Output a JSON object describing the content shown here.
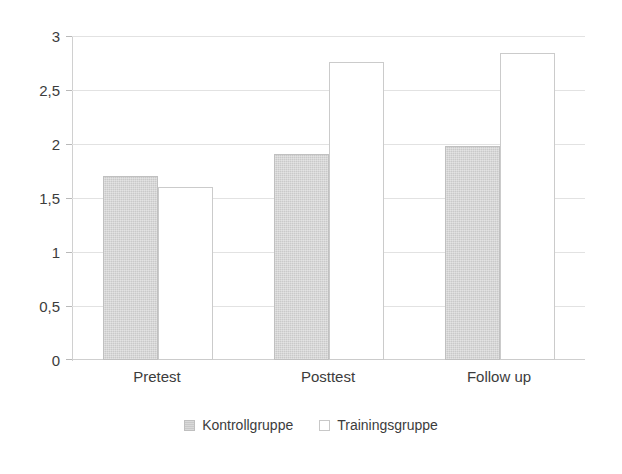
{
  "chart_data": {
    "type": "bar",
    "title": "",
    "subtitle": "",
    "xlabel": "",
    "ylabel": "",
    "categories": [
      "Pretest",
      "Posttest",
      "Follow up"
    ],
    "series": [
      {
        "name": "Kontrollgruppe",
        "values": [
          1.71,
          1.91,
          1.99
        ],
        "color": "#c9c9c9"
      },
      {
        "name": "Trainingsgruppe",
        "values": [
          1.61,
          2.77,
          2.85
        ],
        "color": "#ffffff"
      }
    ],
    "ylim": [
      0,
      3
    ],
    "ytick_values": [
      3,
      2.5,
      2,
      1.5,
      1,
      0.5,
      0
    ],
    "ytick_labels": [
      "3",
      "2,5",
      "2",
      "1,5",
      "1",
      "0,5",
      "0"
    ],
    "grid": true,
    "grid_axis": "y",
    "legend_position": "bottom-center",
    "decimal_separator": ","
  },
  "axes": {
    "y": {
      "ticks": [
        {
          "value": 3,
          "label": "3"
        },
        {
          "value": 2.5,
          "label": "2,5"
        },
        {
          "value": 2,
          "label": "2"
        },
        {
          "value": 1.5,
          "label": "1,5"
        },
        {
          "value": 1,
          "label": "1"
        },
        {
          "value": 0.5,
          "label": "0,5"
        },
        {
          "value": 0,
          "label": "0"
        }
      ]
    },
    "x": {
      "ticks": [
        {
          "label": "Pretest"
        },
        {
          "label": "Posttest"
        },
        {
          "label": "Follow up"
        }
      ]
    }
  },
  "legend": {
    "items": [
      {
        "label": "Kontrollgruppe",
        "swatch": "filled-gray-square"
      },
      {
        "label": "Trainingsgruppe",
        "swatch": "empty-white-square"
      }
    ]
  },
  "colors": {
    "bar_control_fill": "#c9c9c9",
    "bar_training_fill": "#ffffff",
    "bar_outline": "#c6c6c6",
    "gridline": "#e2e2e2",
    "axis": "#d0d0d0",
    "text": "#3c3c3c",
    "background": "#ffffff"
  }
}
